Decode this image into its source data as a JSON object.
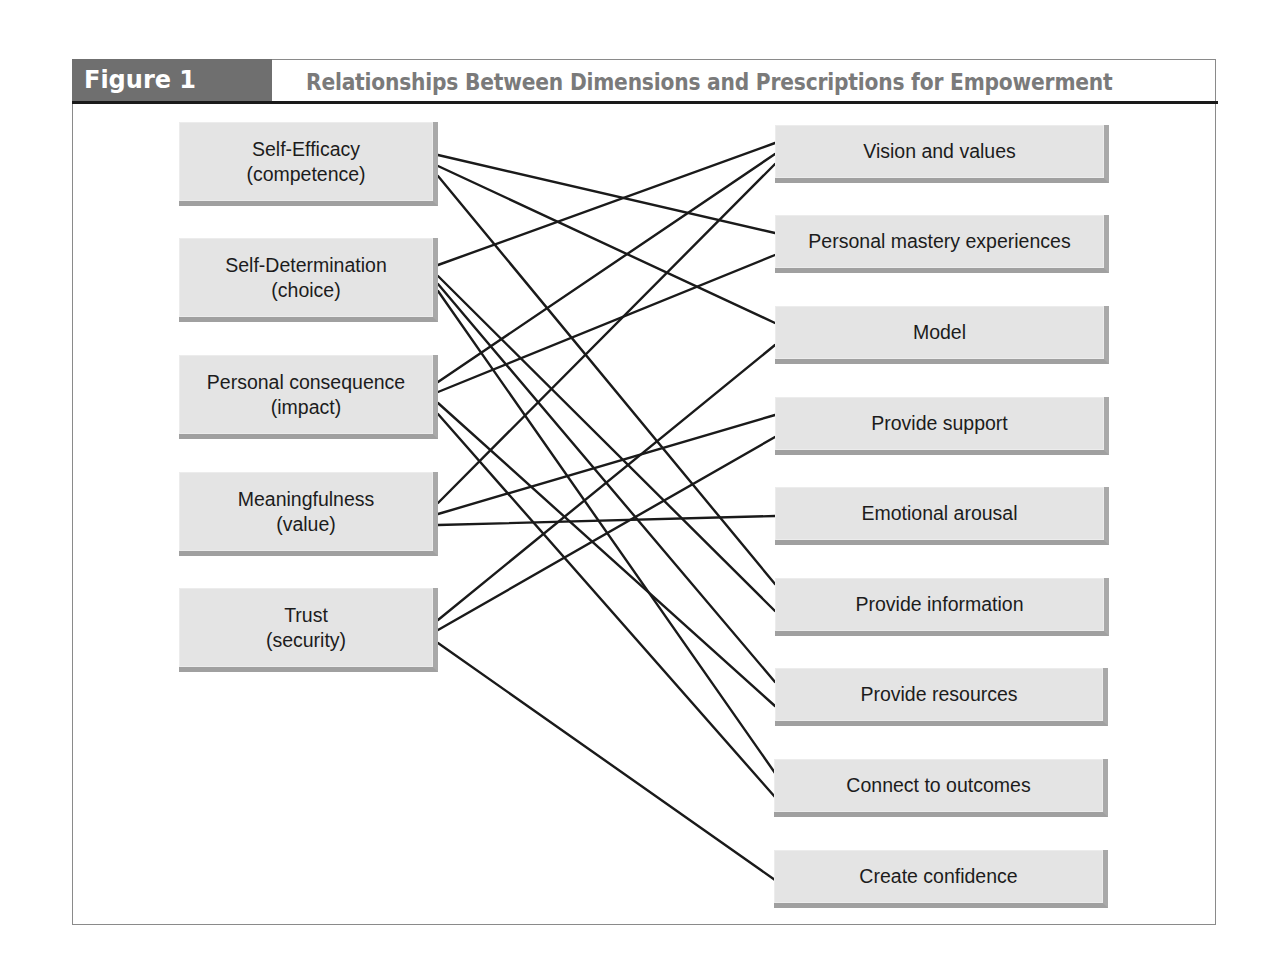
{
  "figure": {
    "label": "Figure 1",
    "title": "Relationships Between Dimensions and Prescriptions for Empowerment"
  },
  "colors": {
    "label_bg": "#6f6f6f",
    "title_text": "#7a7a7a",
    "box_fill": "#e4e4e4",
    "box_shadow": "#a0a0a0",
    "line": "#1a1a1a"
  },
  "dimensions": [
    {
      "id": "self-efficacy",
      "line1": "Self-Efficacy",
      "line2": "(competence)"
    },
    {
      "id": "self-determination",
      "line1": "Self-Determination",
      "line2": "(choice)"
    },
    {
      "id": "personal-consequence",
      "line1": "Personal consequence",
      "line2": "(impact)"
    },
    {
      "id": "meaningfulness",
      "line1": "Meaningfulness",
      "line2": "(value)"
    },
    {
      "id": "trust",
      "line1": "Trust",
      "line2": "(security)"
    }
  ],
  "prescriptions": [
    {
      "id": "vision",
      "label": "Vision and values"
    },
    {
      "id": "mastery",
      "label": "Personal mastery experiences"
    },
    {
      "id": "model",
      "label": "Model"
    },
    {
      "id": "support",
      "label": "Provide support"
    },
    {
      "id": "arousal",
      "label": "Emotional arousal"
    },
    {
      "id": "information",
      "label": "Provide information"
    },
    {
      "id": "resources",
      "label": "Provide resources"
    },
    {
      "id": "outcomes",
      "label": "Connect to outcomes"
    },
    {
      "id": "confidence",
      "label": "Create confidence"
    }
  ],
  "connections": [
    {
      "from": "Self-Efficacy",
      "to": "Personal mastery experiences"
    },
    {
      "from": "Self-Efficacy",
      "to": "Model"
    },
    {
      "from": "Self-Efficacy",
      "to": "Provide information"
    },
    {
      "from": "Self-Determination",
      "to": "Vision and values"
    },
    {
      "from": "Self-Determination",
      "to": "Provide information"
    },
    {
      "from": "Self-Determination",
      "to": "Provide resources"
    },
    {
      "from": "Self-Determination",
      "to": "Connect to outcomes"
    },
    {
      "from": "Personal consequence",
      "to": "Vision and values"
    },
    {
      "from": "Personal consequence",
      "to": "Personal mastery experiences"
    },
    {
      "from": "Personal consequence",
      "to": "Provide resources"
    },
    {
      "from": "Personal consequence",
      "to": "Connect to outcomes"
    },
    {
      "from": "Meaningfulness",
      "to": "Vision and values"
    },
    {
      "from": "Meaningfulness",
      "to": "Provide support"
    },
    {
      "from": "Meaningfulness",
      "to": "Emotional arousal"
    },
    {
      "from": "Trust",
      "to": "Model"
    },
    {
      "from": "Trust",
      "to": "Provide support"
    },
    {
      "from": "Trust",
      "to": "Create confidence"
    }
  ]
}
